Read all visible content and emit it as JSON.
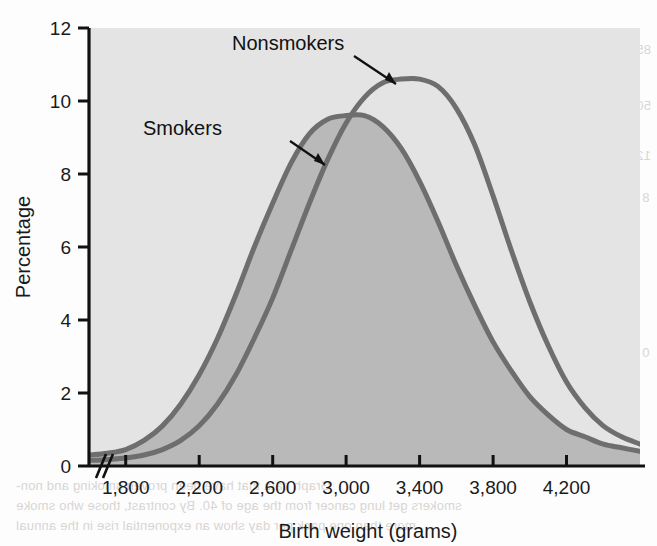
{
  "chart_data": {
    "type": "line",
    "title": "",
    "subtitle": "",
    "xlabel": "Birth weight (grams)",
    "ylabel": "Percentage",
    "xlim": [
      1600,
      4600
    ],
    "ylim": [
      0,
      12
    ],
    "xticks": [
      1800,
      2200,
      2600,
      3000,
      3400,
      3800,
      4200
    ],
    "xticklabels": [
      "1,800",
      "2,200",
      "2,600",
      "3,000",
      "3,400",
      "3,800",
      "4,200"
    ],
    "yticks": [
      0,
      2,
      4,
      6,
      8,
      10,
      12
    ],
    "yticklabels": [
      "0",
      "2",
      "4",
      "6",
      "8",
      "10",
      "12"
    ],
    "grid": false,
    "legend_position": "inline-annotations",
    "axis_break": {
      "axis": "x",
      "symbol": "//",
      "note": "broken x-axis near origin"
    },
    "annotations": [
      {
        "text": "Nonsmokers",
        "series": "Nonsmokers",
        "arrow": true
      },
      {
        "text": "Smokers",
        "series": "Smokers",
        "arrow": true
      }
    ],
    "x": [
      1600,
      1700,
      1800,
      1900,
      2000,
      2100,
      2200,
      2300,
      2400,
      2500,
      2600,
      2700,
      2800,
      2900,
      3000,
      3100,
      3200,
      3300,
      3400,
      3500,
      3600,
      3700,
      3800,
      3900,
      4000,
      4100,
      4200,
      4300,
      4400,
      4500,
      4600
    ],
    "series": [
      {
        "name": "Smokers",
        "color": "#6e6e6e",
        "fill": "#b9b9b9",
        "peak_x": 3100,
        "peak_y": 9.6,
        "values": [
          0.3,
          0.35,
          0.45,
          0.7,
          1.1,
          1.7,
          2.5,
          3.5,
          4.7,
          6.0,
          7.2,
          8.3,
          9.1,
          9.5,
          9.6,
          9.6,
          9.3,
          8.7,
          7.8,
          6.7,
          5.5,
          4.4,
          3.4,
          2.6,
          1.9,
          1.4,
          1.0,
          0.8,
          0.6,
          0.5,
          0.4
        ]
      },
      {
        "name": "Nonsmokers",
        "color": "#6e6e6e",
        "fill": "none",
        "peak_x": 3400,
        "peak_y": 10.6,
        "values": [
          0.15,
          0.18,
          0.22,
          0.3,
          0.45,
          0.7,
          1.1,
          1.7,
          2.5,
          3.5,
          4.6,
          5.9,
          7.2,
          8.4,
          9.4,
          10.1,
          10.5,
          10.6,
          10.6,
          10.4,
          9.8,
          8.8,
          7.4,
          5.9,
          4.5,
          3.3,
          2.3,
          1.6,
          1.1,
          0.8,
          0.6
        ]
      }
    ]
  },
  "chart": {
    "ylabel": "Percentage",
    "xlabel": "Birth weight (grams)",
    "label_nonsmokers": "Nonsmokers",
    "label_smokers": "Smokers",
    "break_symbol": "//",
    "colors": {
      "plot_background": "#e4e4e4",
      "smokers_fill": "#b9b9b9",
      "curve_stroke": "#6e6e6e",
      "axis": "#111111",
      "text": "#1a1a1a",
      "page_background": "#fdfdfd"
    }
  },
  "bleed_through": {
    "right_column": [
      "85",
      "50",
      "12",
      "8",
      "0"
    ],
    "right_vertical": "Number of deaths per 100,000",
    "mid_left": [
      "All causes",
      "Nonsmokers",
      "Smokers"
    ],
    "bottom_lines": [
      "Graph data that have proven smoking and non-",
      "smokers get lung cancer rates from the age of 40. By contrast, those who smoke",
      "more than one pack per day show an exponential rise in the annual"
    ]
  }
}
